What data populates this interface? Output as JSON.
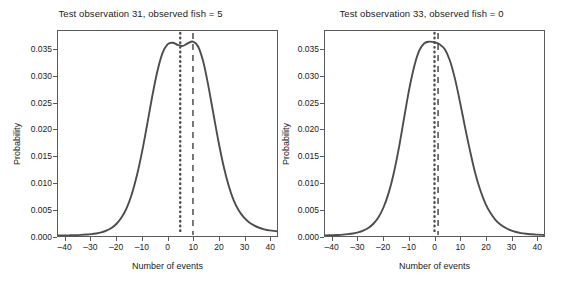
{
  "figure": {
    "background": "#ffffff",
    "curve_color": "#4d4d4d",
    "axis_color": "#5a5a5a",
    "text_color": "#1a1a1a"
  },
  "chart_data": [
    {
      "type": "line",
      "title": "Test observation 31, observed fish = 5",
      "xlabel": "Number of events",
      "ylabel": "Probability",
      "xlim": [
        -43,
        43
      ],
      "ylim": [
        0.0,
        0.0385
      ],
      "xticks": [
        -40,
        -30,
        -20,
        -10,
        0,
        10,
        20,
        30,
        40
      ],
      "xticklabels": [
        "–40",
        "–30",
        "–20",
        "–10",
        "0",
        "10",
        "20",
        "30",
        "40"
      ],
      "yticks": [
        0.0,
        0.005,
        0.01,
        0.015,
        0.02,
        0.025,
        0.03,
        0.035
      ],
      "yticklabels": [
        "0.000",
        "0.005",
        "0.010",
        "0.015",
        "0.020",
        "0.025",
        "0.030",
        "0.035"
      ],
      "grid": false,
      "legend": null,
      "series": [
        {
          "name": "predictive distribution",
          "style": "solid",
          "x": [
            -43,
            -40,
            -38,
            -36,
            -34,
            -32,
            -30,
            -28,
            -26,
            -24,
            -22,
            -20,
            -18,
            -16,
            -14,
            -12,
            -10,
            -8,
            -6,
            -4,
            -2,
            0,
            2,
            4,
            6,
            8,
            10,
            12,
            14,
            16,
            18,
            20,
            22,
            24,
            26,
            28,
            30,
            32,
            34,
            36,
            38,
            40,
            43
          ],
          "y": [
            8e-05,
            0.0001,
            0.00013,
            0.00016,
            0.00021,
            0.00027,
            0.00035,
            0.00048,
            0.00068,
            0.001,
            0.0015,
            0.0023,
            0.0035,
            0.0053,
            0.0079,
            0.0114,
            0.0158,
            0.0209,
            0.0262,
            0.0309,
            0.0343,
            0.036,
            0.0363,
            0.0359,
            0.0357,
            0.0362,
            0.0365,
            0.0356,
            0.0328,
            0.0283,
            0.023,
            0.0178,
            0.0132,
            0.0095,
            0.0067,
            0.0048,
            0.0035,
            0.0026,
            0.002,
            0.00155,
            0.00125,
            0.00105,
            0.0009
          ]
        }
      ],
      "vlines": [
        {
          "name": "observed",
          "x": 5,
          "style": "dotted",
          "label": "observed fish = 5"
        },
        {
          "name": "predicted-mean",
          "x": 10,
          "style": "dashed",
          "label": "predicted mean"
        }
      ]
    },
    {
      "type": "line",
      "title": "Test observation 33, observed fish = 0",
      "xlabel": "Number of events",
      "ylabel": "Probability",
      "xlim": [
        -43,
        43
      ],
      "ylim": [
        0.0,
        0.0385
      ],
      "xticks": [
        -40,
        -30,
        -20,
        -10,
        0,
        10,
        20,
        30,
        40
      ],
      "xticklabels": [
        "–40",
        "–30",
        "–20",
        "–10",
        "0",
        "10",
        "20",
        "30",
        "40"
      ],
      "yticks": [
        0.0,
        0.005,
        0.01,
        0.015,
        0.02,
        0.025,
        0.03,
        0.035
      ],
      "yticklabels": [
        "0.000",
        "0.005",
        "0.010",
        "0.015",
        "0.020",
        "0.025",
        "0.030",
        "0.035"
      ],
      "grid": false,
      "legend": null,
      "series": [
        {
          "name": "predictive distribution",
          "style": "solid",
          "x": [
            -43,
            -40,
            -38,
            -36,
            -34,
            -32,
            -30,
            -28,
            -26,
            -24,
            -22,
            -20,
            -18,
            -16,
            -14,
            -12,
            -10,
            -8,
            -6,
            -4,
            -2,
            0,
            2,
            4,
            6,
            8,
            10,
            12,
            14,
            16,
            18,
            20,
            22,
            24,
            26,
            28,
            30,
            32,
            34,
            36,
            38,
            40,
            43
          ],
          "y": [
            0.00012,
            0.00016,
            0.0002,
            0.00026,
            0.00035,
            0.00048,
            0.00068,
            0.001,
            0.0015,
            0.0023,
            0.0035,
            0.0054,
            0.0081,
            0.0118,
            0.0165,
            0.022,
            0.0274,
            0.0318,
            0.0348,
            0.0362,
            0.0365,
            0.0364,
            0.036,
            0.0351,
            0.033,
            0.0296,
            0.0252,
            0.0204,
            0.0159,
            0.0118,
            0.0086,
            0.0061,
            0.0043,
            0.003,
            0.0021,
            0.0015,
            0.00105,
            0.00075,
            0.00055,
            0.00042,
            0.00033,
            0.00026,
            0.0002
          ]
        }
      ],
      "vlines": [
        {
          "name": "observed",
          "x": 0,
          "style": "dotted",
          "label": "observed fish = 0"
        },
        {
          "name": "predicted-mean",
          "x": 1.4,
          "style": "dashed",
          "label": "predicted mean"
        }
      ]
    }
  ]
}
